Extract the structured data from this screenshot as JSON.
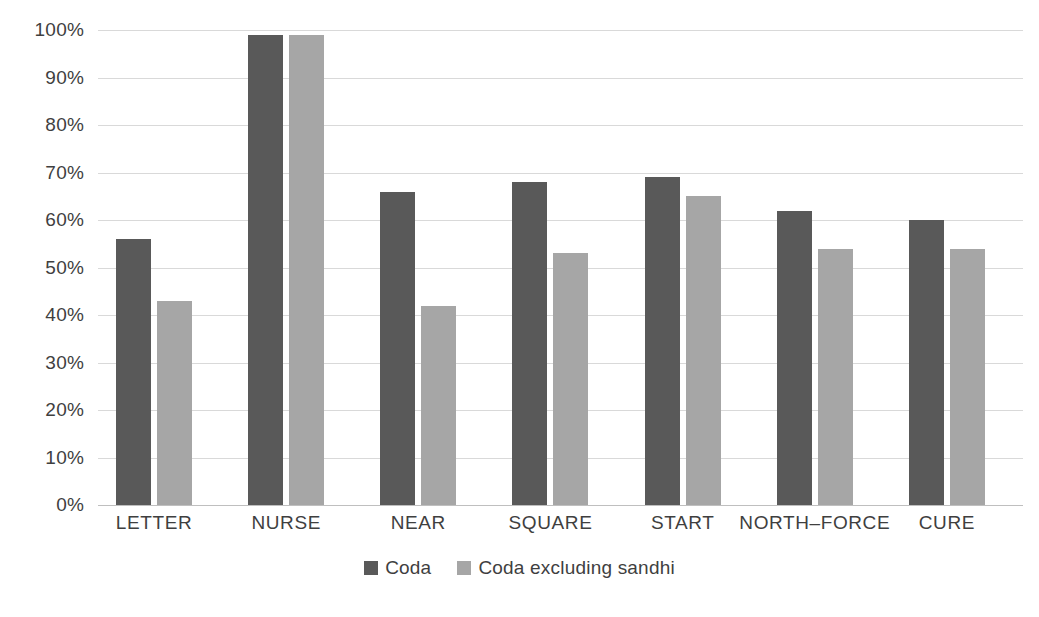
{
  "chart_data": {
    "type": "bar",
    "title": "",
    "subtitle": "",
    "xlabel": "",
    "ylabel": "",
    "ylim": [
      0,
      100
    ],
    "y_ticks": [
      "0%",
      "10%",
      "20%",
      "30%",
      "40%",
      "50%",
      "60%",
      "70%",
      "80%",
      "90%",
      "100%"
    ],
    "y_tick_values": [
      0,
      10,
      20,
      30,
      40,
      50,
      60,
      70,
      80,
      90,
      100
    ],
    "y_unit": "%",
    "grid": true,
    "grid_axis": "y",
    "legend_position": "bottom-center",
    "categories": [
      "LETTER",
      "NURSE",
      "NEAR",
      "SQUARE",
      "START",
      "NORTH–FORCE",
      "CURE"
    ],
    "series": [
      {
        "name": "Coda",
        "color": "#595959",
        "values": [
          56,
          99,
          66,
          68,
          69,
          62,
          60
        ]
      },
      {
        "name": "Coda excluding sandhi",
        "color": "#a6a6a6",
        "values": [
          43,
          99,
          42,
          53,
          65,
          54,
          54
        ]
      }
    ]
  },
  "colors": {
    "series_dark": "#595959",
    "series_light": "#a6a6a6",
    "gridline": "#d9d9d9",
    "baseline": "#bfbfbf",
    "text": "#3f3f3f",
    "background": "#ffffff"
  }
}
